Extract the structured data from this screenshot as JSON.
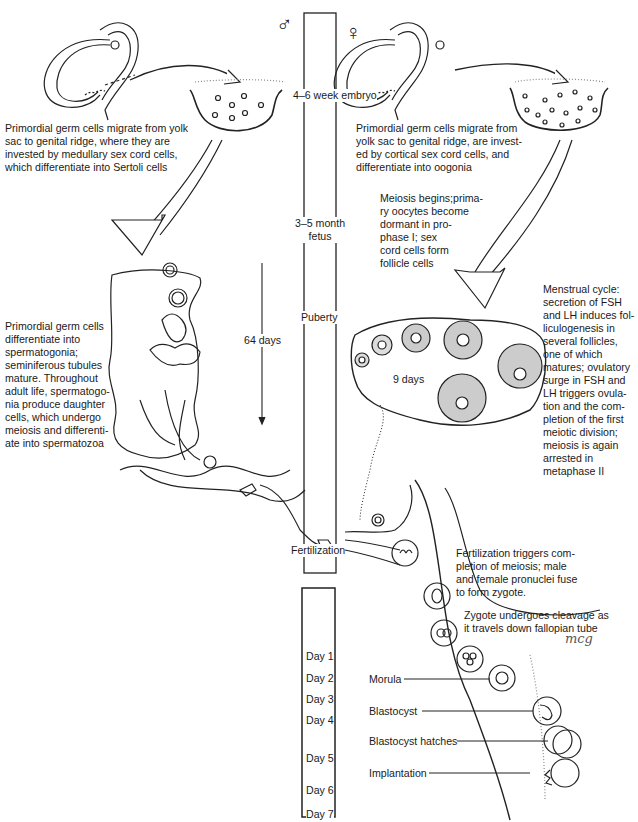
{
  "symbols": {
    "male": "♂",
    "female": "♀"
  },
  "timeline": {
    "stages": [
      "4–6 week embryo",
      "3–5 month\nfetus",
      "Puberty",
      "Fertilization"
    ],
    "days": [
      "Day 1",
      "Day 2",
      "Day 3",
      "Day 4",
      "Day 5",
      "Day 6",
      "Day 7"
    ]
  },
  "male": {
    "migration_text": "Primordial germ cells migrate from yolk\nsac to genital ridge, where they are\ninvested by medullary sex cord cells,\nwhich differentiate into Sertoli cells",
    "spermatogenesis_text": "Primordial germ cells\ndifferentiate into\nspermatogonia;\nseminiferous tubules\nmature. Throughout\nadult life, spermatogo-\nnia produce daughter\ncells, which undergo\nmeiosis and differenti-\nate into spermatozoa",
    "duration_label": "64 days"
  },
  "female": {
    "migration_text": "Primordial germ cells migrate from\nyolk sac to genital ridge, are invest-\ned by cortical sex cord cells, and\ndifferentiate into oogonia",
    "meiosis_text": "Meiosis begins;prima-\nry oocytes become\ndormant in pro-\nphase I; sex\ncord cells form\nfollicle cells",
    "menstrual_text": "Menstrual cycle:\nsecretion of FSH\nand LH induces fol-\nliculogenesis in\nseveral follicles,\none of which\nmatures; ovulatory\nsurge in FSH and\nLH triggers ovula-\ntion and the com-\npletion of the first\nmeiotic division;\nmeiosis is again\narrested in\nmetaphase II",
    "duration_label": "9 days"
  },
  "fertilization_text": "Fertilization triggers com-\npletion of meiosis; male\nand female pronuclei fuse\nto form zygote.",
  "cleavage_text": "Zygote undergoes cleavage as\nit travels down fallopian tube",
  "embryo_labels": [
    "Morula",
    "Blastocyst",
    "Blastocyst hatches",
    "Implantation"
  ],
  "signature": "mcg"
}
